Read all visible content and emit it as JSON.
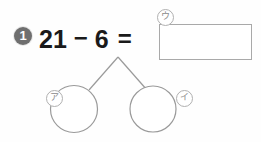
{
  "worksheet": {
    "width": 261,
    "height": 142,
    "background_color": "#fefefe",
    "subject": "arithmetic-subtraction-decomposition"
  },
  "problem": {
    "number_badge": "1",
    "badge_color": "#6f6f6f",
    "badge_text_color": "#ffffff"
  },
  "equation": {
    "left_operand": "21",
    "operator": "−",
    "right_operand": "6",
    "equals": "=",
    "text_color": "#1a1a1a",
    "full_text": "21 − 6 ="
  },
  "answer_box": {
    "label": "ウ",
    "value": "",
    "placeholder": "",
    "border_color": "#a9a9a9",
    "fill_color": "#ffffff"
  },
  "decomposition": {
    "stroke_color": "#9a9a9a",
    "left_circle": {
      "label": "ア",
      "value": "",
      "cx": 74,
      "cy": 109,
      "r": 23.5
    },
    "right_circle": {
      "label": "イ",
      "value": "",
      "cx": 153,
      "cy": 109,
      "r": 23.0
    },
    "apex": {
      "x": 118,
      "y": 57
    }
  },
  "labels": {
    "kana_u": "ウ",
    "kana_a": "ア",
    "kana_i": "イ",
    "label_border_color": "#b0b0b0",
    "label_text_color": "#8a8a8a"
  }
}
